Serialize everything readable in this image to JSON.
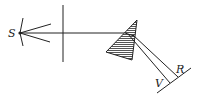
{
  "diagram": {
    "labels": {
      "source": "S",
      "violet": "V",
      "red": "R"
    },
    "colors": {
      "stroke": "#222222",
      "prism_fill": "#9a9a9a",
      "background": "#ffffff"
    }
  }
}
